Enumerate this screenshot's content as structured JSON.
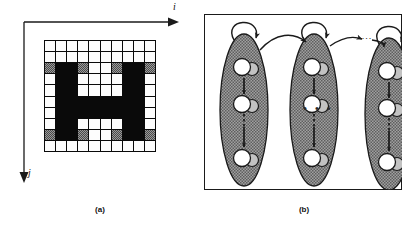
{
  "figure": {
    "panel_a": {
      "caption": "(a)",
      "axis_horizontal_label": "i",
      "axis_vertical_label": "j",
      "grid": {
        "columns": 10,
        "rows": 10,
        "legend": {
          "w": "white-pixel",
          "k": "black-pixel",
          "g": "gray-hatched-pixel"
        },
        "cells": [
          [
            "w",
            "w",
            "w",
            "w",
            "w",
            "w",
            "w",
            "w",
            "w",
            "w"
          ],
          [
            "w",
            "w",
            "w",
            "w",
            "w",
            "w",
            "w",
            "w",
            "w",
            "w"
          ],
          [
            "g",
            "k",
            "k",
            "g",
            "w",
            "w",
            "g",
            "k",
            "k",
            "g"
          ],
          [
            "w",
            "k",
            "k",
            "w",
            "w",
            "w",
            "w",
            "k",
            "k",
            "w"
          ],
          [
            "w",
            "k",
            "k",
            "w",
            "w",
            "w",
            "w",
            "k",
            "k",
            "w"
          ],
          [
            "w",
            "k",
            "k",
            "k",
            "k",
            "k",
            "k",
            "k",
            "k",
            "w"
          ],
          [
            "w",
            "k",
            "k",
            "k",
            "k",
            "k",
            "k",
            "k",
            "k",
            "w"
          ],
          [
            "w",
            "k",
            "k",
            "w",
            "w",
            "w",
            "w",
            "k",
            "k",
            "w"
          ],
          [
            "g",
            "k",
            "k",
            "g",
            "w",
            "w",
            "g",
            "k",
            "k",
            "g"
          ],
          [
            "w",
            "w",
            "w",
            "w",
            "w",
            "w",
            "w",
            "w",
            "w",
            "w"
          ]
        ]
      }
    },
    "panel_b": {
      "caption": "(b)",
      "ellipsis_horizontal": "...",
      "ellipsis_middle": "• • •",
      "states": [
        {
          "name": "state-column-1",
          "self_loop": true,
          "nodes": [
            "node-pair-top",
            "node-pair-middle",
            "node-pair-bottom"
          ],
          "vertical_ellipsis": true
        },
        {
          "name": "state-column-2",
          "self_loop": true,
          "nodes": [
            "node-pair-top",
            "node-pair-middle",
            "node-pair-bottom"
          ],
          "vertical_ellipsis": true
        },
        {
          "name": "state-column-3",
          "self_loop": true,
          "nodes": [
            "node-pair-top",
            "node-pair-middle",
            "node-pair-bottom"
          ],
          "vertical_ellipsis": true
        }
      ],
      "transitions": [
        "state-1-to-state-2",
        "state-2-to-dots",
        "dots-to-state-3"
      ]
    }
  },
  "colors": {
    "ink": "#1a1a1a",
    "paper": "#ffffff",
    "gray_fill": "#9a9a9a",
    "node_fill": "#ffffff",
    "node_shadow": "#b5b5b5"
  }
}
